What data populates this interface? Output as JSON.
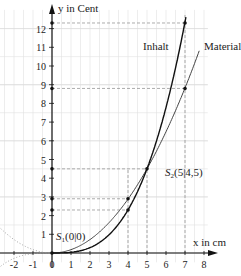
{
  "chart_data": {
    "type": "line",
    "title": "",
    "xlabel": "x in cm",
    "ylabel": "y in Cent",
    "xlim": [
      -2,
      8
    ],
    "ylim": [
      0,
      12.5
    ],
    "x_ticks": [
      -2,
      -1,
      0,
      1,
      2,
      3,
      4,
      5,
      6,
      7,
      8
    ],
    "y_ticks": [
      1,
      2,
      3,
      4,
      5,
      6,
      7,
      8,
      9,
      10,
      11,
      12
    ],
    "grid": true,
    "series": [
      {
        "name": "Inhalt",
        "formula": "y = 0.036x^3",
        "x": [
          0,
          1,
          2,
          3,
          4,
          5,
          6,
          7
        ],
        "values": [
          0,
          0.036,
          0.288,
          0.972,
          2.304,
          4.5,
          7.776,
          12.348
        ]
      },
      {
        "name": "Material",
        "formula": "y = 0.18x^2",
        "x": [
          0,
          1,
          2,
          3,
          4,
          5,
          6,
          7,
          7.6
        ],
        "values": [
          0,
          0.18,
          0.72,
          1.62,
          2.88,
          4.5,
          6.48,
          8.82,
          10.4
        ]
      }
    ],
    "points": [
      {
        "label": "S1(0|0)",
        "x": 0,
        "y": 0
      },
      {
        "label": "S2(5|4,5)",
        "x": 5,
        "y": 4.5
      },
      {
        "x": 4,
        "y": 2.3
      },
      {
        "x": 4,
        "y": 2.9
      },
      {
        "x": 7,
        "y": 8.8
      },
      {
        "x": 7,
        "y": 12.3
      }
    ],
    "annotations": [
      "S1(0|0)",
      "S2(5|4,5)",
      "Inhalt",
      "Material"
    ]
  },
  "labels": {
    "y_axis": "y in Cent",
    "x_axis": "x in cm",
    "inhalt": "Inhalt",
    "material": "Material",
    "s1": "S",
    "s1_sub": "1",
    "s1_rest": "(0|0)",
    "s2": "S",
    "s2_sub": "2",
    "s2_rest": "(5|4,5)"
  }
}
